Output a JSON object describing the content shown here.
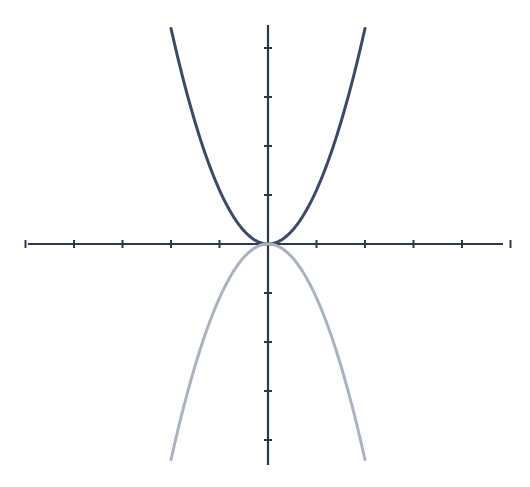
{
  "chart_data": {
    "type": "line",
    "title": "",
    "xlabel": "",
    "ylabel": "",
    "xlim": [
      -5,
      5
    ],
    "ylim": [
      -4.5,
      4.5
    ],
    "grid": false,
    "legend": null,
    "x_ticks": [
      -5,
      -4,
      -3,
      -2,
      -1,
      1,
      2,
      3,
      4,
      5
    ],
    "y_ticks": [
      -4,
      -3,
      -2,
      -1,
      1,
      2,
      3,
      4
    ],
    "tick_labels_shown": false,
    "series": [
      {
        "name": "upper parabola",
        "formula": "y = a*x^2",
        "a": 1.1,
        "x_range": [
          -2,
          2
        ],
        "color": "#3b4a66"
      },
      {
        "name": "lower parabola",
        "formula": "y = -a*x^2",
        "a": 1.1,
        "x_range": [
          -2,
          2
        ],
        "color": "#a9b3c1"
      }
    ]
  },
  "style": {
    "axis_color": "#2c3852",
    "background": "#ffffff"
  },
  "layout": {
    "origin_px": [
      268,
      244
    ],
    "unit_x_px": 48.5,
    "unit_y_px": 49,
    "x_axis_px": [
      28,
      503
    ],
    "y_axis_px": [
      25,
      465
    ]
  }
}
